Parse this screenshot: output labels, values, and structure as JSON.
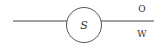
{
  "diagram": {
    "node": {
      "label": "S",
      "shape": "circle",
      "stroke_color": "#555555"
    },
    "left_edge": {
      "label": ""
    },
    "right_edge": {
      "label_top": "O",
      "label_bottom": "W"
    },
    "line_color": "#444444",
    "text_color": "#333333"
  }
}
